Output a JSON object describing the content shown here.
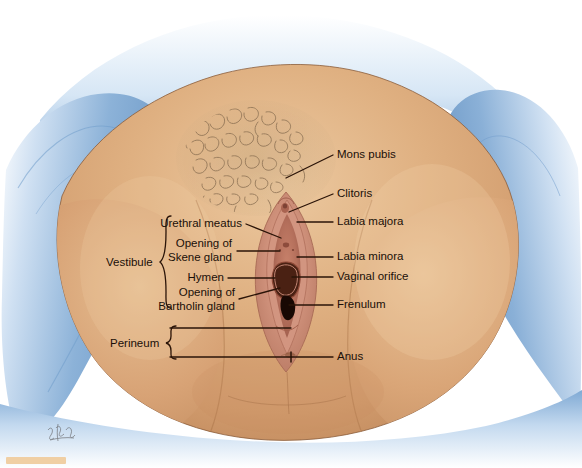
{
  "figure": {
    "view": "lithotomy position, draped",
    "artist_signature": "illegible cursive artist signature, lower left"
  },
  "colors": {
    "background": "#ffffff",
    "drape_blue": "#7fa9d4",
    "drape_blue_light": "#cfe0f2",
    "drape_blue_dark": "#4d7fb5",
    "skin": "#dba87a",
    "skin_light": "#e8c49b",
    "skin_shadow": "#c28f62",
    "mucosa_pink": "#d79b87",
    "mucosa_deep": "#b5705c",
    "orifice_dark": "#2b1108",
    "hair": "#8e7258",
    "leader_line": "#2b1408",
    "label_text": "#1a0f08",
    "swatch": "#f0cfa4"
  },
  "labels": {
    "right": [
      {
        "id": "mons-pubis",
        "text": "Mons pubis"
      },
      {
        "id": "clitoris",
        "text": "Clitoris"
      },
      {
        "id": "labia-majora",
        "text": "Labia majora"
      },
      {
        "id": "labia-minora",
        "text": "Labia minora"
      },
      {
        "id": "vaginal-orifice",
        "text": "Vaginal orifice"
      },
      {
        "id": "frenulum",
        "text": "Frenulum"
      },
      {
        "id": "anus",
        "text": "Anus"
      }
    ],
    "left": [
      {
        "id": "urethral-meatus",
        "text": "Urethral meatus"
      },
      {
        "id": "opening-of-skene-gland",
        "line1": "Opening of",
        "line2": "Skene gland"
      },
      {
        "id": "hymen",
        "text": "Hymen"
      },
      {
        "id": "opening-of-bartholin-gland",
        "line1": "Opening of",
        "line2": "Bartholin gland"
      }
    ],
    "brackets": [
      {
        "id": "vestibule",
        "text": "Vestibule"
      },
      {
        "id": "perineum",
        "text": "Perineum"
      }
    ]
  }
}
